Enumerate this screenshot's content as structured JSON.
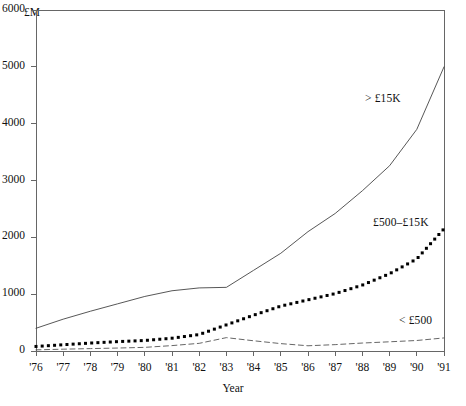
{
  "chart_data": {
    "type": "line",
    "title": "",
    "subtitle": "",
    "xlabel": "Year",
    "ylabel": "£M",
    "unit_label": "£M",
    "grid": false,
    "legend_position": "inline-annotations",
    "x": [
      "'76",
      "'77",
      "'78",
      "'79",
      "'80",
      "'81",
      "'82",
      "'83",
      "'84",
      "'85",
      "'86",
      "'87",
      "'88",
      "'89",
      "'90",
      "'91"
    ],
    "x_numeric": [
      1976,
      1977,
      1978,
      1979,
      1980,
      1981,
      1982,
      1983,
      1984,
      1985,
      1986,
      1987,
      1988,
      1989,
      1990,
      1991
    ],
    "xlim": [
      1976,
      1991
    ],
    "ylim": [
      0,
      6000
    ],
    "yticks": [
      0,
      1000,
      2000,
      3000,
      4000,
      5000,
      6000
    ],
    "ytick_labels": [
      "0",
      "1000",
      "2000",
      "3000",
      "4000",
      "5000",
      "6000"
    ],
    "series": [
      {
        "name": "> £15K",
        "style": "solid",
        "color": "#444444",
        "values": [
          400,
          560,
          700,
          830,
          960,
          1060,
          1110,
          1120,
          1420,
          1720,
          2100,
          2420,
          2820,
          3260,
          3900,
          5000
        ]
      },
      {
        "name": "£500–£15K",
        "style": "dotted",
        "color": "#000000",
        "values": [
          80,
          110,
          140,
          165,
          185,
          225,
          290,
          460,
          630,
          790,
          900,
          1010,
          1160,
          1360,
          1620,
          2150
        ]
      },
      {
        "name": "< £500",
        "style": "dashed",
        "color": "#555555",
        "values": [
          20,
          32,
          42,
          52,
          64,
          95,
          135,
          235,
          180,
          130,
          92,
          112,
          140,
          162,
          185,
          230
        ]
      }
    ]
  },
  "annotations": {
    "series_high": "> £15K",
    "series_mid": "£500–£15K",
    "series_low": "< £500"
  },
  "axes": {
    "y_unit": "£M",
    "x_title": "Year"
  }
}
